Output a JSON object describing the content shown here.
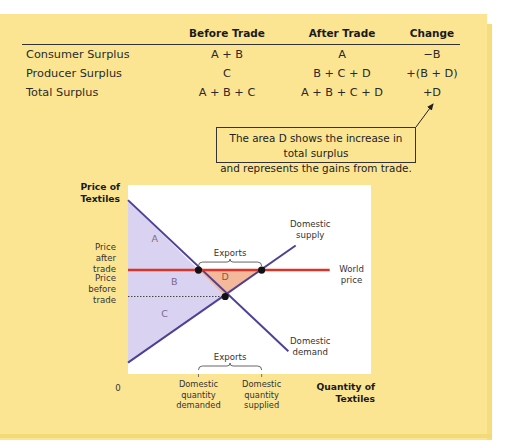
{
  "table": {
    "headers": [
      "",
      "Before Trade",
      "After Trade",
      "Change"
    ],
    "rows": [
      {
        "label": "Consumer Surplus",
        "before": "A + B",
        "after": "A",
        "change": "−B"
      },
      {
        "label": "Producer Surplus",
        "before": "C",
        "after": "B + C + D",
        "change": "+(B + D)"
      },
      {
        "label": "Total Surplus",
        "before": "A + B + C",
        "after": "A + B + C + D",
        "change": "+D"
      }
    ]
  },
  "callout": {
    "line1": "The area D shows the increase in total surplus",
    "line2": "and represents the gains from trade."
  },
  "colors": {
    "panel": "#fbe593",
    "surplus_fill": "#d9d2f0",
    "gain_fill": "#f4b99a",
    "curve": "#4e3f97",
    "world_price": "#d9332a",
    "point": "#111111"
  },
  "chart_data": {
    "type": "line",
    "title": "",
    "ylabel_lines": [
      "Price of",
      "Textiles"
    ],
    "xlabel_lines": [
      "Quantity of",
      "Textiles"
    ],
    "origin_label": "0",
    "xlim": [
      0,
      100
    ],
    "ylim": [
      0,
      100
    ],
    "grid": false,
    "series": [
      {
        "name": "Domestic demand",
        "label_lines": [
          "Domestic",
          "demand"
        ],
        "points": [
          [
            0,
            92
          ],
          [
            66,
            12
          ]
        ]
      },
      {
        "name": "Domestic supply",
        "label_lines": [
          "Domestic",
          "supply"
        ],
        "points": [
          [
            0,
            6
          ],
          [
            69,
            68
          ]
        ]
      },
      {
        "name": "World price",
        "label_lines": [
          "World",
          "price"
        ],
        "points": [
          [
            0,
            55
          ],
          [
            83,
            55
          ]
        ]
      }
    ],
    "price_after_trade": 55,
    "price_before_trade": 41,
    "equilibrium": [
      40,
      41
    ],
    "quantity_demanded_after": 29,
    "quantity_supplied_after": 55,
    "y_tick_labels": [
      {
        "value": 55,
        "lines": [
          "Price",
          "after",
          "trade"
        ]
      },
      {
        "value": 41,
        "lines": [
          "Price",
          "before",
          "trade"
        ]
      }
    ],
    "x_tick_labels": [
      {
        "value": 29,
        "lines": [
          "Domestic",
          "quantity",
          "demanded"
        ]
      },
      {
        "value": 55,
        "lines": [
          "Domestic",
          "quantity",
          "supplied"
        ]
      }
    ],
    "areas": [
      {
        "name": "A",
        "label": "A"
      },
      {
        "name": "B",
        "label": "B"
      },
      {
        "name": "C",
        "label": "C"
      },
      {
        "name": "D",
        "label": "D"
      }
    ],
    "annotations": [
      {
        "text": "Exports",
        "position": "above world price between dots"
      },
      {
        "text": "Exports",
        "position": "above x-axis between quantities"
      }
    ]
  }
}
